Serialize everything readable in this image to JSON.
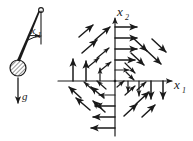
{
  "figure": {
    "ink_color": "#1a1a1a",
    "background_color": "#ffffff",
    "width": 193,
    "height": 141
  },
  "pendulum": {
    "name": "pendulum-diagram",
    "angle_label": "x",
    "angle_label_sub": "1",
    "gravity_label": "g",
    "pivot": {
      "cx": 41,
      "cy": 10,
      "r": 2.4
    },
    "bob": {
      "cx": 18,
      "cy": 68,
      "r": 8
    },
    "rod": {
      "x1": 41,
      "y1": 10,
      "x2": 18,
      "y2": 68
    },
    "vertical_reference": {
      "x1": 41,
      "y1": 10,
      "x2": 41,
      "y2": 46
    },
    "angle_arc": {
      "cx": 41,
      "cy": 10,
      "r": 30,
      "start_deg": 90,
      "end_deg": 112
    },
    "gravity_arrow": {
      "x1": 18,
      "y1": 79,
      "x2": 18,
      "y2": 106
    },
    "angle_tick_arrow": {
      "x1": 28,
      "y1": 36,
      "x2": 40,
      "y2": 36
    }
  },
  "chart_data": {
    "type": "scatter",
    "subtype": "vector-field",
    "title": "",
    "xlabel": "x1",
    "ylabel": "x2",
    "xlabel_base": "x",
    "xlabel_sub": "1",
    "ylabel_base": "x",
    "ylabel_sub": "2",
    "origin": {
      "x": 115,
      "y": 81
    },
    "xlim": [
      -60,
      68
    ],
    "ylim": [
      -60,
      70
    ],
    "grid": false,
    "axes": {
      "x_axis": {
        "x1": 58,
        "y1": 81,
        "x2": 176,
        "y2": 81,
        "arrow_end": true
      },
      "y_axis": {
        "x1": 115,
        "y1": 136,
        "x2": 115,
        "y2": 14,
        "arrow_end": true
      }
    },
    "legend": null,
    "vectors": [
      {
        "x": 115,
        "y": 27,
        "dx": 22,
        "dy": 0
      },
      {
        "x": 115,
        "y": 38,
        "dx": 22,
        "dy": 0
      },
      {
        "x": 115,
        "y": 49,
        "dx": 22,
        "dy": 0
      },
      {
        "x": 115,
        "y": 60,
        "dx": 20,
        "dy": 0
      },
      {
        "x": 115,
        "y": 70,
        "dx": 14,
        "dy": 0
      },
      {
        "x": 139,
        "y": 81,
        "dx": 0,
        "dy": 15
      },
      {
        "x": 151,
        "y": 81,
        "dx": 0,
        "dy": 18
      },
      {
        "x": 163,
        "y": 81,
        "dx": 0,
        "dy": 18
      },
      {
        "x": 128,
        "y": 81,
        "dx": 0,
        "dy": 11
      },
      {
        "x": 115,
        "y": 95,
        "dx": -16,
        "dy": 0
      },
      {
        "x": 115,
        "y": 106,
        "dx": -20,
        "dy": 0
      },
      {
        "x": 115,
        "y": 117,
        "dx": -22,
        "dy": 0
      },
      {
        "x": 115,
        "y": 128,
        "dx": -24,
        "dy": 0
      },
      {
        "x": 100,
        "y": 81,
        "dx": 0,
        "dy": -13
      },
      {
        "x": 86,
        "y": 81,
        "dx": 0,
        "dy": -20
      },
      {
        "x": 73,
        "y": 81,
        "dx": 0,
        "dy": -22
      },
      {
        "x": 82,
        "y": 53,
        "dx": 15,
        "dy": -13
      },
      {
        "x": 95,
        "y": 40,
        "dx": 15,
        "dy": -13
      },
      {
        "x": 79,
        "y": 37,
        "dx": 14,
        "dy": -12
      },
      {
        "x": 97,
        "y": 58,
        "dx": 12,
        "dy": -10
      },
      {
        "x": 101,
        "y": 70,
        "dx": 10,
        "dy": -8
      },
      {
        "x": 88,
        "y": 67,
        "dx": 11,
        "dy": -9
      },
      {
        "x": 132,
        "y": 37,
        "dx": 15,
        "dy": 14
      },
      {
        "x": 146,
        "y": 50,
        "dx": 15,
        "dy": 14
      },
      {
        "x": 131,
        "y": 53,
        "dx": 13,
        "dy": 12
      },
      {
        "x": 125,
        "y": 63,
        "dx": 10,
        "dy": 10
      },
      {
        "x": 152,
        "y": 39,
        "dx": 14,
        "dy": 13
      },
      {
        "x": 126,
        "y": 72,
        "dx": 8,
        "dy": 8
      },
      {
        "x": 90,
        "y": 110,
        "dx": -14,
        "dy": -12
      },
      {
        "x": 104,
        "y": 98,
        "dx": -13,
        "dy": -11
      },
      {
        "x": 81,
        "y": 98,
        "dx": -12,
        "dy": -11
      },
      {
        "x": 105,
        "y": 112,
        "dx": -12,
        "dy": -11
      },
      {
        "x": 106,
        "y": 89,
        "dx": -9,
        "dy": -8
      },
      {
        "x": 94,
        "y": 91,
        "dx": -10,
        "dy": -9
      },
      {
        "x": 136,
        "y": 104,
        "dx": 13,
        "dy": -12
      },
      {
        "x": 124,
        "y": 116,
        "dx": 13,
        "dy": -12
      },
      {
        "x": 142,
        "y": 117,
        "dx": 13,
        "dy": -12
      },
      {
        "x": 125,
        "y": 95,
        "dx": 10,
        "dy": -9
      },
      {
        "x": 137,
        "y": 90,
        "dx": 9,
        "dy": -8
      },
      {
        "x": 117,
        "y": 87,
        "dx": 7,
        "dy": -6
      }
    ]
  }
}
